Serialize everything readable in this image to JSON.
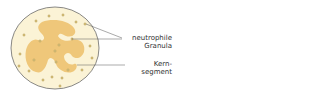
{
  "diagram": {
    "colors": {
      "cytoplasm": "#fbf3d6",
      "nucleus": "#efc77a",
      "granule": "#d9c27a",
      "outline": "#6b6b6b"
    },
    "labels": [
      {
        "id": "granula",
        "lines": [
          "neutrophile",
          "Granula"
        ]
      },
      {
        "id": "kernsegment",
        "lines": [
          "Kern-",
          "segment"
        ]
      }
    ]
  }
}
